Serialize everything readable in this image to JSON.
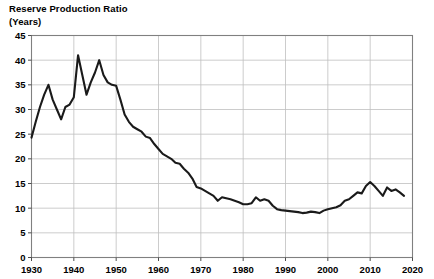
{
  "chart_data": {
    "type": "line",
    "title": "Reserve Production Ratio",
    "subtitle": "(Years)",
    "xlabel": "",
    "ylabel": "Reserve Production Ratio (Years)",
    "xlim": [
      1930,
      2020
    ],
    "ylim": [
      0,
      45
    ],
    "grid": true,
    "legend": "none",
    "accent_color": "#1a1a1a",
    "grid_color": "#bfbfbf",
    "frame_color": "#808080",
    "yticks": [
      0,
      5,
      10,
      15,
      20,
      25,
      30,
      35,
      40,
      45
    ],
    "xticks": [
      1930,
      1940,
      1950,
      1960,
      1970,
      1980,
      1990,
      2000,
      2010,
      2020
    ],
    "ytick_labels": [
      "0",
      "5",
      "10",
      "15",
      "20",
      "25",
      "30",
      "35",
      "40",
      "45"
    ],
    "xtick_labels": [
      "1930",
      "1940",
      "1950",
      "1960",
      "1970",
      "1980",
      "1990",
      "2000",
      "2010",
      "2020"
    ],
    "series": [
      {
        "name": "Reserve Production Ratio",
        "x": [
          1930,
          1931,
          1932,
          1933,
          1934,
          1935,
          1936,
          1937,
          1938,
          1939,
          1940,
          1941,
          1942,
          1943,
          1944,
          1945,
          1946,
          1947,
          1948,
          1949,
          1950,
          1951,
          1952,
          1953,
          1954,
          1955,
          1956,
          1957,
          1958,
          1959,
          1960,
          1961,
          1962,
          1963,
          1964,
          1965,
          1966,
          1967,
          1968,
          1969,
          1970,
          1971,
          1972,
          1973,
          1974,
          1975,
          1976,
          1977,
          1978,
          1979,
          1980,
          1981,
          1982,
          1983,
          1984,
          1985,
          1986,
          1987,
          1988,
          1989,
          1990,
          1991,
          1992,
          1993,
          1994,
          1995,
          1996,
          1997,
          1998,
          1999,
          2000,
          2001,
          2002,
          2003,
          2004,
          2005,
          2006,
          2007,
          2008,
          2009,
          2010,
          2011,
          2012,
          2013,
          2014,
          2015,
          2016,
          2017,
          2018
        ],
        "values": [
          24.3,
          27.5,
          30.5,
          33.0,
          35.0,
          32.0,
          30.0,
          28.0,
          30.5,
          31.0,
          32.5,
          41.0,
          37.0,
          33.0,
          35.5,
          37.5,
          40.0,
          37.0,
          35.5,
          35.0,
          34.8,
          32.0,
          29.0,
          27.5,
          26.5,
          26.0,
          25.5,
          24.5,
          24.2,
          23.0,
          22.0,
          21.0,
          20.5,
          20.0,
          19.2,
          19.0,
          18.0,
          17.2,
          16.0,
          14.3,
          14.0,
          13.5,
          13.0,
          12.5,
          11.5,
          12.2,
          12.0,
          11.8,
          11.5,
          11.2,
          10.8,
          10.8,
          11.0,
          12.2,
          11.5,
          11.8,
          11.5,
          10.5,
          9.8,
          9.6,
          9.5,
          9.4,
          9.3,
          9.2,
          9.0,
          9.1,
          9.3,
          9.2,
          9.0,
          9.5,
          9.8,
          10.0,
          10.2,
          10.6,
          11.5,
          11.8,
          12.5,
          13.2,
          13.0,
          14.5,
          15.3,
          14.5,
          13.5,
          12.5,
          14.2,
          13.5,
          13.8,
          13.2,
          12.5
        ]
      }
    ]
  },
  "axis": {
    "y_caption": "Reserve Production Ratio",
    "y_unit": "(Years)"
  }
}
